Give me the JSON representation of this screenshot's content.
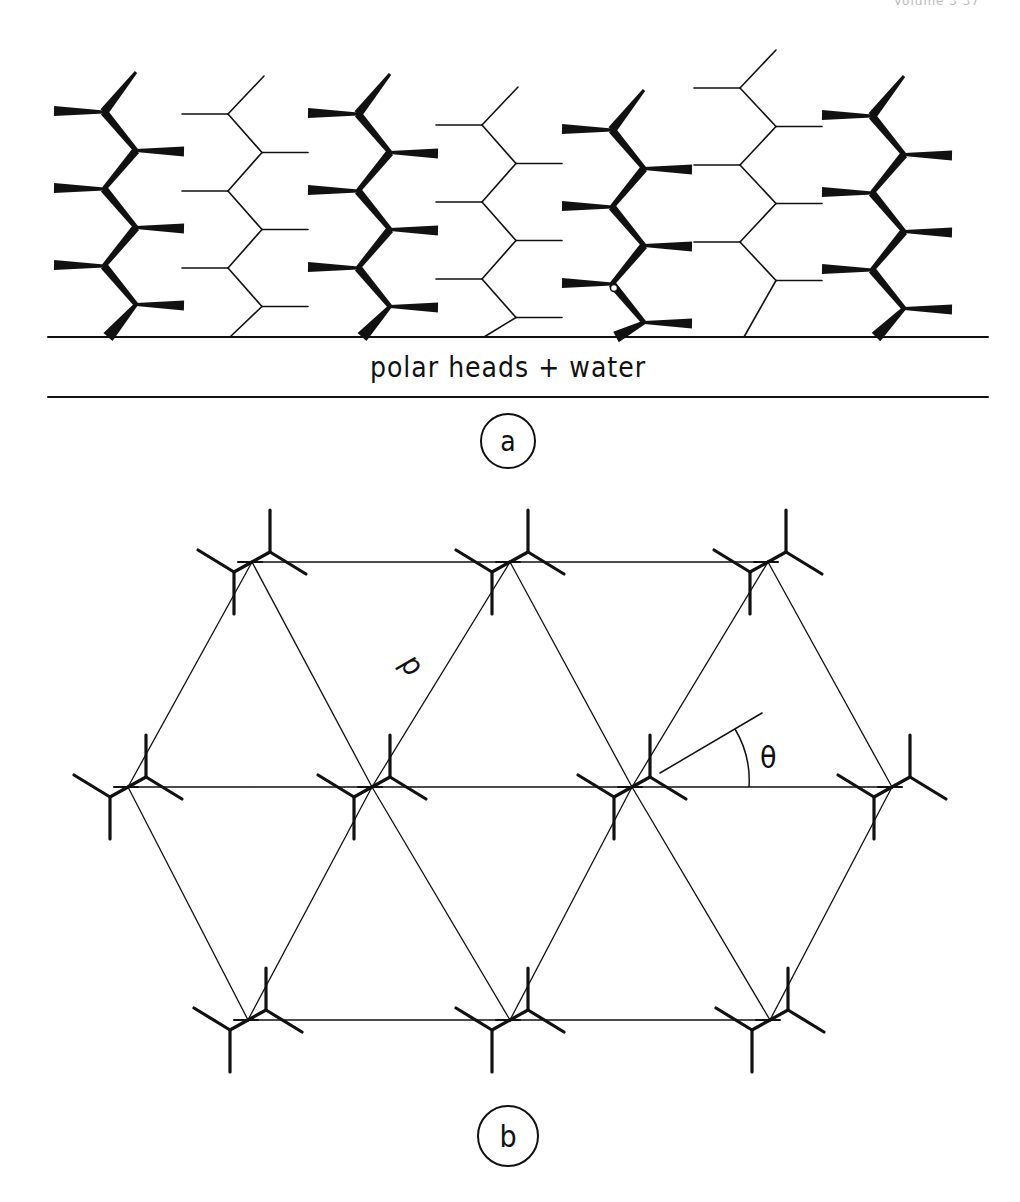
{
  "page_header": {
    "text": "Volume 3      37"
  },
  "panel_a": {
    "label": "a",
    "band_label": "polar heads + water",
    "band_top_y": 337,
    "band_bottom_y": 397,
    "band_x_start": 48,
    "band_x_end": 988,
    "label_circle": {
      "cx": 508,
      "cy": 441,
      "r": 27
    },
    "chains": [
      {
        "type": "bold",
        "spine_x_left": 104,
        "spine_x_right": 136,
        "top_y": 66,
        "shift": 0
      },
      {
        "type": "thin",
        "spine_x_left": 228,
        "spine_x_right": 262,
        "top_y": 68,
        "shift": 0
      },
      {
        "type": "bold",
        "spine_x_left": 358,
        "spine_x_right": 390,
        "top_y": 68,
        "shift": 0
      },
      {
        "type": "thin",
        "spine_x_left": 482,
        "spine_x_right": 516,
        "top_y": 76,
        "shift": 3
      },
      {
        "type": "bold",
        "spine_x_left": 612,
        "spine_x_right": 644,
        "top_y": 78,
        "shift": 6,
        "defect": true
      },
      {
        "type": "thin",
        "spine_x_left": 740,
        "spine_x_right": 776,
        "top_y": 58,
        "shift": -16
      },
      {
        "type": "bold",
        "spine_x_left": 872,
        "spine_x_right": 904,
        "top_y": 72,
        "shift": -2
      }
    ]
  },
  "panel_b": {
    "label": "b",
    "distance_label": "d",
    "angle_label": "θ",
    "label_circle": {
      "cx": 508,
      "cy": 1136,
      "r": 30
    },
    "lattice_rows": [
      {
        "y": 562,
        "x": [
          252,
          510,
          768
        ]
      },
      {
        "y": 787,
        "x": [
          128,
          372,
          632,
          892
        ]
      },
      {
        "y": 1020,
        "x": [
          248,
          510,
          770
        ]
      }
    ]
  }
}
